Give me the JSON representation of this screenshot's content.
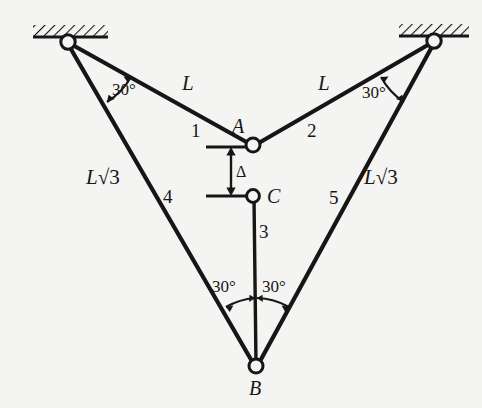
{
  "figure": {
    "background_color": "#f4f4f2",
    "ink_color": "#161616"
  },
  "supports": [
    {
      "name": "left-wall-support",
      "x": 68,
      "y": 42,
      "hatch_from_x": 33,
      "hatch_to_x": 108
    },
    {
      "name": "right-wall-support",
      "x": 434,
      "y": 41,
      "hatch_from_x": 399,
      "hatch_to_x": 469
    }
  ],
  "joints": [
    {
      "id": "A",
      "label": "A",
      "x": 253,
      "y": 145,
      "label_x": 232,
      "label_y": 116
    },
    {
      "id": "C",
      "label": "C",
      "x": 253,
      "y": 196,
      "label_x": 267,
      "label_y": 186
    },
    {
      "id": "B",
      "label": "B",
      "x": 256,
      "y": 366,
      "label_x": 249,
      "label_y": 378
    }
  ],
  "members": [
    {
      "number": "1",
      "label_x": 191,
      "label_y": 121,
      "from": "left-support",
      "to": "A",
      "length_label": "L"
    },
    {
      "number": "2",
      "label_x": 307,
      "label_y": 121,
      "from": "right-support",
      "to": "A",
      "length_label": "L"
    },
    {
      "number": "3",
      "label_x": 259,
      "label_y": 222,
      "from": "C",
      "to": "B",
      "length_label": ""
    },
    {
      "number": "4",
      "label_x": 163,
      "label_y": 187,
      "from": "left-support",
      "to": "B",
      "length_label": "L√3"
    },
    {
      "number": "5",
      "label_x": 329,
      "label_y": 188,
      "from": "right-support",
      "to": "B",
      "length_label": "L√3"
    }
  ],
  "length_labels": [
    {
      "id": "L-left",
      "text": "L",
      "x": 182,
      "y": 73
    },
    {
      "id": "L-right",
      "text": "L",
      "x": 318,
      "y": 73
    },
    {
      "id": "Lsqrt3-left",
      "prefix": "L",
      "radical": "√",
      "radicand": "3",
      "x": 86,
      "y": 167
    },
    {
      "id": "Lsqrt3-right",
      "prefix": "L",
      "radical": "√",
      "radicand": "3",
      "x": 364,
      "y": 167
    }
  ],
  "angles": [
    {
      "id": "angle-left-support",
      "text": "30°",
      "x": 112,
      "y": 81
    },
    {
      "id": "angle-right-support",
      "text": "30°",
      "x": 362,
      "y": 84
    },
    {
      "id": "angle-b-left",
      "text": "30°",
      "x": 212,
      "y": 278
    },
    {
      "id": "angle-b-right",
      "text": "30°",
      "x": 262,
      "y": 278
    }
  ],
  "dimension": {
    "id": "delta-gap",
    "symbol": "Δ",
    "label_x": 236,
    "label_y": 164,
    "top_y": 147,
    "bottom_y": 196,
    "arrow_x": 231,
    "tick_from_x": 206,
    "tick_to_x": 256
  }
}
